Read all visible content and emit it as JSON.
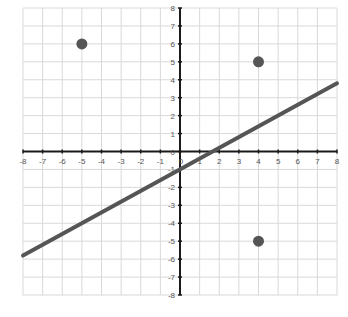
{
  "chart_data": {
    "type": "scatter",
    "title": "",
    "xlabel": "",
    "ylabel": "",
    "xlim": [
      -8,
      8
    ],
    "ylim": [
      -8,
      8
    ],
    "grid": true,
    "legend": null,
    "x_ticks": [
      -8,
      -7,
      -6,
      -5,
      -4,
      -3,
      -2,
      -1,
      0,
      1,
      2,
      3,
      4,
      5,
      6,
      7,
      8
    ],
    "y_ticks": [
      -8,
      -7,
      -6,
      -5,
      -4,
      -3,
      -2,
      -1,
      0,
      1,
      2,
      3,
      4,
      5,
      6,
      7,
      8
    ],
    "series": [
      {
        "name": "points",
        "type": "scatter",
        "color": "#555555",
        "points": [
          {
            "x": -5,
            "y": 6
          },
          {
            "x": 4,
            "y": 5
          },
          {
            "x": 4,
            "y": -5
          }
        ]
      },
      {
        "name": "line",
        "type": "line",
        "color": "#555555",
        "slope": 0.6,
        "intercept": -1,
        "points": [
          {
            "x": -8,
            "y": -5.8
          },
          {
            "x": 8,
            "y": 3.8
          }
        ]
      }
    ]
  },
  "layout": {
    "plot_left": 23,
    "plot_right": 337,
    "plot_top": 8,
    "plot_bottom": 295,
    "colors": {
      "grid": "#d9d9d9",
      "axis": "#1a1a1a",
      "series": "#555555",
      "label": "#555555"
    }
  }
}
